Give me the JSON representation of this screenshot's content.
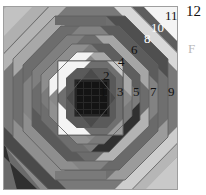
{
  "figure": {
    "background_color": "#ffffff",
    "block": {
      "x": 3,
      "y": 6,
      "width": 175,
      "height": 184,
      "base_color": "#8a8a8a",
      "border_color": "#9e9e9e"
    },
    "palette": {
      "center_dark": "#1b1b1b",
      "very_dark": "#2b2b2b",
      "dark": "#3f3f3f",
      "mid_dark": "#565656",
      "mid": "#6e6e6e",
      "mid_gray": "#7d7d7d",
      "gray": "#8c8c8c",
      "light_gray": "#a3a3a3",
      "lighter_gray": "#b5b5b5",
      "pale": "#cfcfcf",
      "white": "#f6f6f6",
      "label_dark": "#111111",
      "label_light": "#ffffff"
    },
    "ring_labels": [
      {
        "id": "ring-1",
        "text": "1",
        "x": 100,
        "y": 92,
        "tone": "dark"
      },
      {
        "id": "ring-2",
        "text": "2",
        "x": 103,
        "y": 76,
        "tone": "dark"
      },
      {
        "id": "ring-3",
        "text": "3",
        "x": 117,
        "y": 92,
        "tone": "dark"
      },
      {
        "id": "ring-4",
        "text": "4",
        "x": 118,
        "y": 62,
        "tone": "dark"
      },
      {
        "id": "ring-5",
        "text": "5",
        "x": 133,
        "y": 92,
        "tone": "dark"
      },
      {
        "id": "ring-6",
        "text": "6",
        "x": 131,
        "y": 50,
        "tone": "dark"
      },
      {
        "id": "ring-7",
        "text": "7",
        "x": 150,
        "y": 92,
        "tone": "dark"
      },
      {
        "id": "ring-8",
        "text": "8",
        "x": 144,
        "y": 39,
        "tone": "light"
      },
      {
        "id": "ring-9",
        "text": "9",
        "x": 168,
        "y": 92,
        "tone": "dark"
      },
      {
        "id": "ring-10",
        "text": "10",
        "x": 152,
        "y": 27,
        "tone": "light"
      },
      {
        "id": "ring-11",
        "text": "11",
        "x": 166,
        "y": 15,
        "tone": "dark"
      }
    ],
    "outer_label": {
      "text": "12",
      "x": 186,
      "y": 8
    },
    "side_letter": {
      "text": "F",
      "x": 186,
      "y": 45
    }
  }
}
